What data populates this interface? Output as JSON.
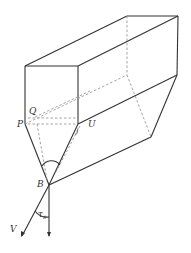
{
  "figure": {
    "labels": {
      "Q": "Q",
      "P": "P",
      "U": "U",
      "J": "J",
      "B": "B",
      "V": "V",
      "tau": "τ",
      "tau_sub": "s"
    },
    "colors": {
      "line": "#333333",
      "hidden": "#9a9a9a",
      "background": "#ffffff"
    }
  }
}
